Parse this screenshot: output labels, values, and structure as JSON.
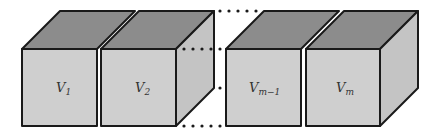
{
  "diagram": {
    "type": "row-of-cubes",
    "colors": {
      "front_face": "#cfcfcf",
      "top_face": "#8c8c8c",
      "side_face": "#c4c4c4",
      "edge": "#1a1a1a"
    },
    "cubes": [
      {
        "label_main": "V",
        "label_sub": "1"
      },
      {
        "label_main": "V",
        "label_sub": "2"
      },
      {
        "label_main": "V",
        "label_sub": "m−1"
      },
      {
        "label_main": "V",
        "label_sub": "m"
      }
    ],
    "ellipsis": "dotted continuation between cube 2 and cube m−1"
  }
}
